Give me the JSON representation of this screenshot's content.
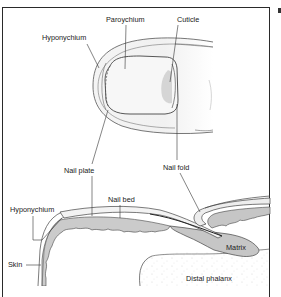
{
  "figure": {
    "type": "anatomical-diagram",
    "top_view_labels": {
      "paroychium": "Paroychium",
      "cuticle": "Cuticle",
      "hyponychium": "Hyponychium",
      "nail_plate": "Nail plate",
      "nail_fold": "Nail fold"
    },
    "section_view_labels": {
      "hyponychium": "Hyponychium",
      "nail_bed": "Nail bed",
      "skin": "Skin",
      "matrix": "Matrix",
      "distal_phalanx": "Distal phalanx"
    },
    "colors": {
      "outline": "#4a4a4a",
      "nail_fill": "#f2f2f2",
      "lunula_shade": "#c8c8c8",
      "matrix_fill": "#c9c9c9",
      "bone_speckle": "#d8d8d8",
      "frame": "#2a2a2a"
    }
  }
}
